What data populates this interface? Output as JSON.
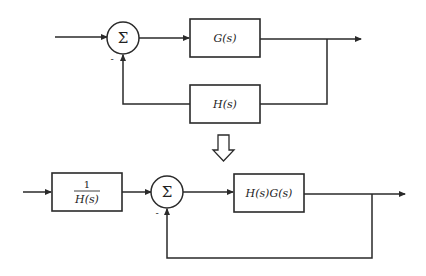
{
  "diagram": {
    "type": "block-diagram-equivalence",
    "top": {
      "summing_symbol": "Σ",
      "feedback_sign": "-",
      "forward_block": "G(s)",
      "feedback_block": "H(s)"
    },
    "transform_arrow": "down-arrow",
    "bottom": {
      "prefilter_numerator": "1",
      "prefilter_denominator": "H(s)",
      "summing_symbol": "Σ",
      "feedback_sign": "-",
      "forward_block": "H(s)G(s)",
      "feedback": "unity"
    },
    "colors": {
      "line": "#2a2a2a",
      "background": "#ffffff"
    }
  }
}
